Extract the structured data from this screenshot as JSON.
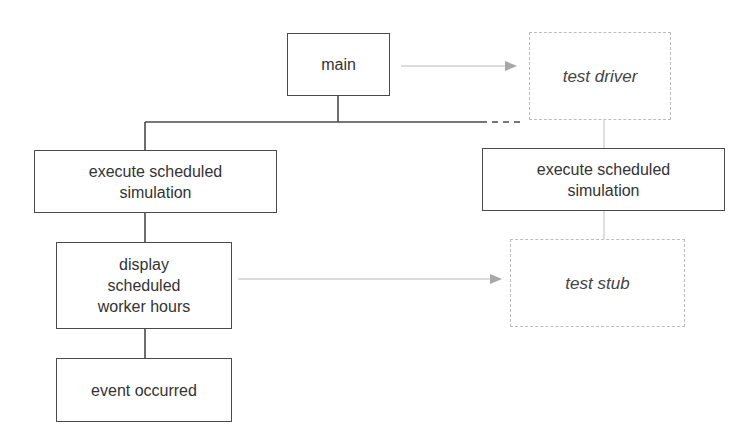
{
  "diagram": {
    "nodes": {
      "main": {
        "label": "main",
        "style": "solid"
      },
      "test_driver": {
        "label": "test driver",
        "style": "dashed"
      },
      "exec_left": {
        "label": "execute scheduled\nsimulation",
        "style": "solid"
      },
      "exec_right": {
        "label": "execute scheduled\nsimulation",
        "style": "solid"
      },
      "display": {
        "label": "display\nscheduled\nworker hours",
        "style": "solid"
      },
      "test_stub": {
        "label": "test stub",
        "style": "dashed"
      },
      "event": {
        "label": "event occurred",
        "style": "solid"
      }
    },
    "edges": [
      {
        "from": "main",
        "to": "exec_left",
        "type": "solid-tree"
      },
      {
        "from": "main",
        "to": "exec_right",
        "type": "dashed-tree"
      },
      {
        "from": "main",
        "to": "test_driver",
        "type": "replaced-by-arrow"
      },
      {
        "from": "test_driver",
        "to": "exec_right",
        "type": "light-line"
      },
      {
        "from": "exec_left",
        "to": "display",
        "type": "solid-tree"
      },
      {
        "from": "display",
        "to": "event",
        "type": "solid-tree"
      },
      {
        "from": "display",
        "to": "test_stub",
        "type": "replaced-by-arrow"
      },
      {
        "from": "exec_right",
        "to": "test_stub",
        "type": "light-line"
      }
    ],
    "colors": {
      "solid_stroke": "#4a4a4a",
      "dashed_stroke": "#bdbdbd",
      "arrow": "#a8a8a8",
      "text": "#333333",
      "background": "#ffffff"
    }
  }
}
